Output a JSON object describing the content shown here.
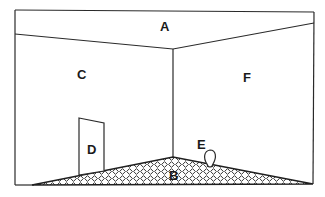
{
  "diagram": {
    "type": "room-perspective",
    "labels": {
      "ceiling": "A",
      "floor": "B",
      "left_wall": "C",
      "door": "D",
      "object": "E",
      "right_wall": "F"
    },
    "colors": {
      "line": "#2a2a2a",
      "background": "#ffffff",
      "floor_pattern": "#3a3a3a"
    }
  }
}
